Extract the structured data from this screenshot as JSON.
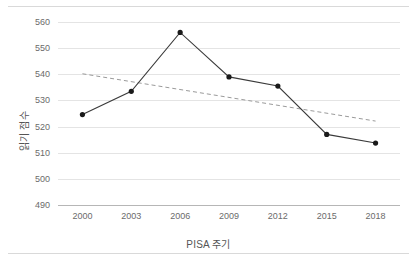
{
  "chart_data": {
    "type": "line",
    "title": "",
    "subtitle": "",
    "xlabel": "PISA 주기",
    "ylabel": "읽기 점수",
    "categories": [
      "2000",
      "2003",
      "2006",
      "2009",
      "2012",
      "2015",
      "2018"
    ],
    "values": [
      524.6,
      533.5,
      556.0,
      539.0,
      535.5,
      517.0,
      513.7
    ],
    "series": [
      {
        "name": "읽기 점수",
        "values": [
          524.6,
          533.5,
          556.0,
          539.0,
          535.5,
          517.0,
          513.7
        ],
        "marker": "circle",
        "color": "#1a1a1a",
        "style": "solid"
      },
      {
        "name": "추세선",
        "style": "dashed",
        "color": "#9a9a9a",
        "endpoints": [
          {
            "x": "2000",
            "y": 540.2
          },
          {
            "x": "2018",
            "y": 522.1
          }
        ]
      }
    ],
    "ylim": [
      490,
      560
    ],
    "yticks": [
      490,
      500,
      510,
      520,
      530,
      540,
      550,
      560
    ],
    "ytick_labels": [
      "490",
      "500",
      "510",
      "520",
      "530",
      "540",
      "550",
      "560"
    ],
    "xtick_labels": [
      "2000",
      "2003",
      "2006",
      "2009",
      "2012",
      "2015",
      "2018"
    ],
    "grid": "horizontal",
    "legend": "none",
    "annotations": []
  },
  "colors": {
    "series_line": "#3a3a3a",
    "marker": "#1a1a1a",
    "trendline": "#9a9a9a",
    "gridline": "#e4e4e4",
    "axis_line": "#b6b6b6",
    "tick_text": "#6b6b6b",
    "axis_title": "#555555",
    "frame": "#d9d9d9",
    "background": "#ffffff"
  }
}
